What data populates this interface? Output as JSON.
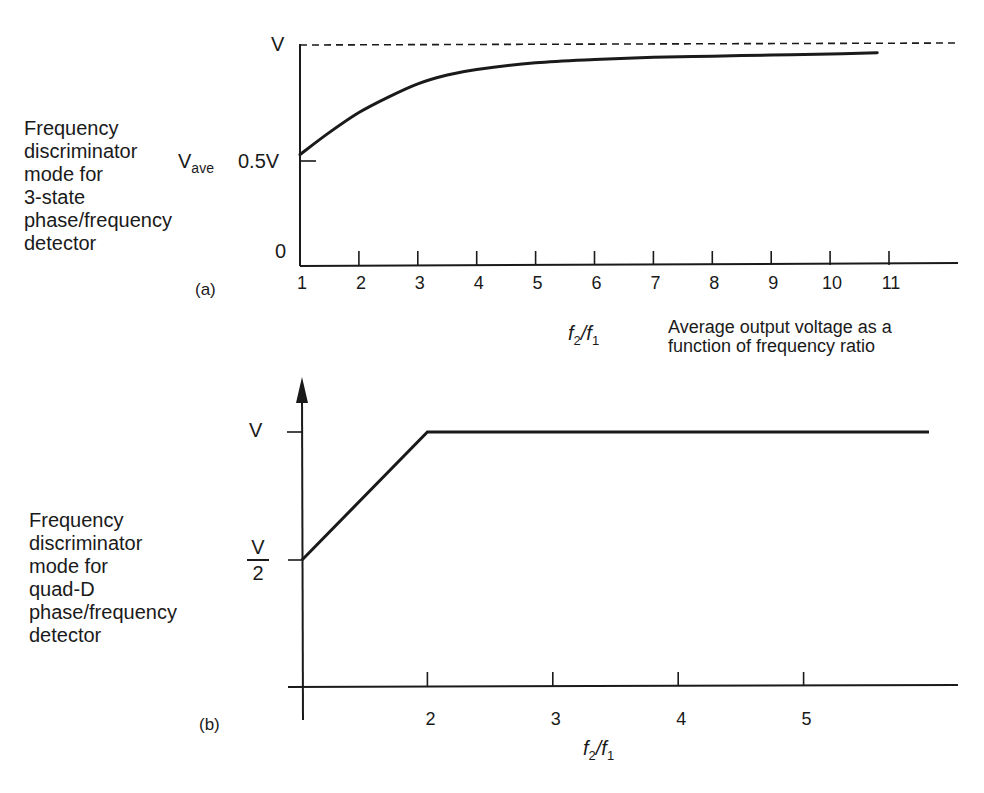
{
  "chart_data": [
    {
      "id": "a",
      "type": "line",
      "panel_label": "(a)",
      "side_title": "Frequency\ndiscriminator\nmode for\n3-state\nphase/frequency\ndetector",
      "ylabel": "V_ave",
      "ylabel_main": "V",
      "ylabel_sub": "ave",
      "ytick_labels": [
        "0",
        "0.5V",
        "V"
      ],
      "yticks": [
        0,
        0.5,
        1.0
      ],
      "ylim": [
        0,
        1.0
      ],
      "xlabel": "f2/f1",
      "xlabel_parts": {
        "f": "f",
        "num_sub": "2",
        "den_sub": "1"
      },
      "x_ticks": [
        1,
        2,
        3,
        4,
        5,
        6,
        7,
        8,
        9,
        10,
        11
      ],
      "xlim": [
        1,
        12.1
      ],
      "caption": "Average output voltage as a\nfunction of frequency ratio",
      "asymptote": {
        "y": 1.0,
        "style": "dashed",
        "label": "V"
      },
      "grid": false,
      "series": [
        {
          "name": "V_ave",
          "x": [
            1,
            1.5,
            2,
            2.5,
            3,
            3.5,
            4,
            5,
            6,
            7,
            8,
            9,
            10,
            10.8
          ],
          "y": [
            0.5,
            0.6,
            0.69,
            0.76,
            0.82,
            0.86,
            0.885,
            0.915,
            0.93,
            0.94,
            0.945,
            0.95,
            0.955,
            0.96
          ]
        }
      ]
    },
    {
      "id": "b",
      "type": "line",
      "panel_label": "(b)",
      "side_title": "Frequency\ndiscriminator\nmode for\nquad-D\nphase/frequency\ndetector",
      "ytick_labels": [
        "V/2",
        "V"
      ],
      "ytick_frac": {
        "num": "V",
        "den": "2"
      },
      "ytick_top": "V",
      "yticks": [
        0.5,
        1.0
      ],
      "ylim": [
        0,
        1.2
      ],
      "xlabel": "f2/f1",
      "xlabel_parts": {
        "f": "f",
        "num_sub": "2",
        "den_sub": "1"
      },
      "x_ticks": [
        2,
        3,
        4,
        5
      ],
      "xlim": [
        1,
        6.3
      ],
      "y_axis_arrow": true,
      "grid": false,
      "series": [
        {
          "name": "V_out",
          "x": [
            1,
            2,
            6.0
          ],
          "y": [
            0.5,
            1.0,
            1.0
          ]
        }
      ]
    }
  ]
}
